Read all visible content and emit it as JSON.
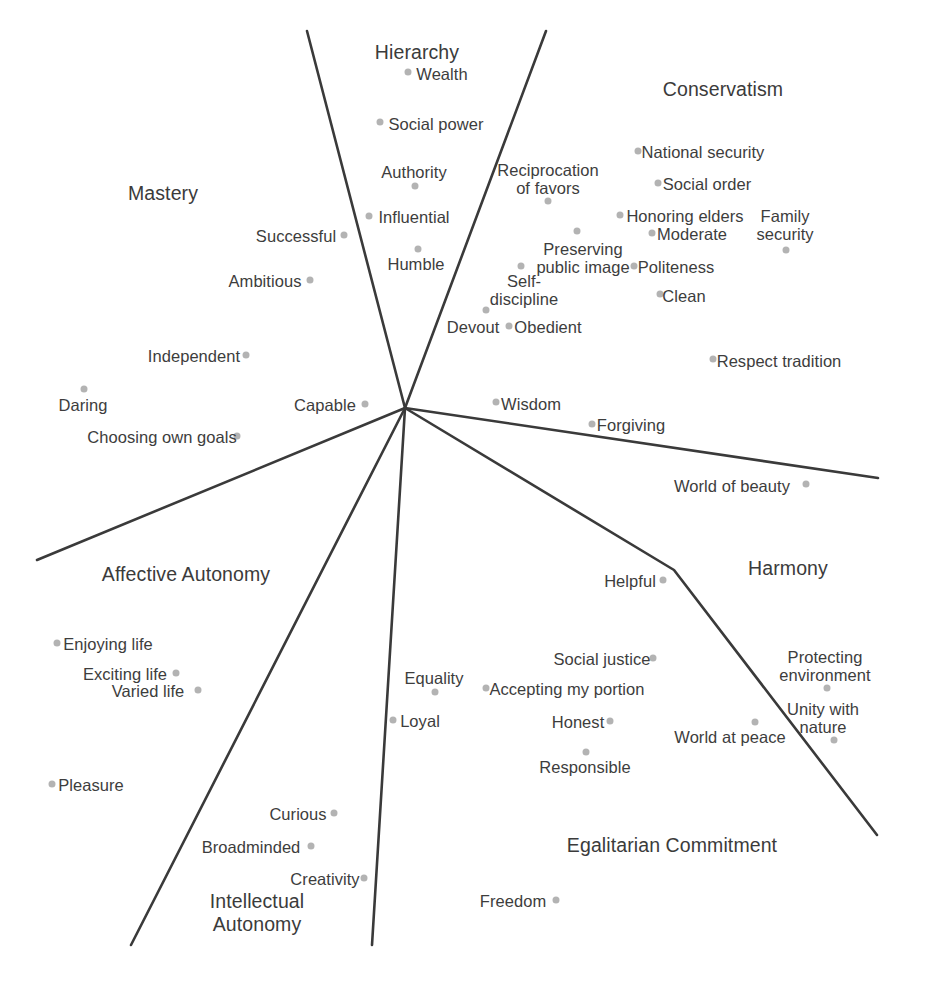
{
  "figure": {
    "type": "scatter",
    "title": "",
    "background_color": "#ffffff",
    "dot_color": "#b3b3b3",
    "line_color": "#3a3a3a",
    "text_color": "#3d3d3d",
    "width": 926,
    "height": 982,
    "origin": {
      "x": 405,
      "y": 408
    }
  },
  "regions": [
    {
      "name": "hierarchy",
      "label": "Hierarchy",
      "x": 417,
      "y": 52
    },
    {
      "name": "conservatism",
      "label": "Conservatism",
      "x": 723,
      "y": 89
    },
    {
      "name": "mastery",
      "label": "Mastery",
      "x": 163,
      "y": 193
    },
    {
      "name": "affective-autonomy",
      "label": "Affective Autonomy",
      "x": 186,
      "y": 574
    },
    {
      "name": "harmony",
      "label": "Harmony",
      "x": 788,
      "y": 568
    },
    {
      "name": "egalitarian-commitment",
      "label": "Egalitarian Commitment",
      "x": 672,
      "y": 845
    },
    {
      "name": "intellectual-autonomy",
      "label": "Intellectual\nAutonomy",
      "x": 257,
      "y": 913
    }
  ],
  "dividers": [
    {
      "name": "hierarchy-mastery-divider",
      "points": [
        [
          307,
          31
        ],
        [
          405,
          408
        ]
      ]
    },
    {
      "name": "hierarchy-conservatism-divider",
      "points": [
        [
          546,
          31
        ],
        [
          405,
          408
        ]
      ]
    },
    {
      "name": "conservatism-harmony-divider",
      "points": [
        [
          405,
          408
        ],
        [
          878,
          478
        ]
      ]
    },
    {
      "name": "harmony-egalitarian-divider",
      "points": [
        [
          405,
          408
        ],
        [
          674,
          570
        ],
        [
          877,
          835
        ]
      ]
    },
    {
      "name": "egalitarian-intellectual-divider",
      "points": [
        [
          405,
          408
        ],
        [
          372,
          945
        ]
      ]
    },
    {
      "name": "intellectual-affective-divider",
      "points": [
        [
          405,
          408
        ],
        [
          131,
          945
        ]
      ]
    },
    {
      "name": "affective-mastery-divider",
      "points": [
        [
          405,
          408
        ],
        [
          37,
          560
        ]
      ]
    }
  ],
  "values": [
    {
      "name": "wealth",
      "label": "Wealth",
      "tx": 442,
      "ty": 74,
      "dx": 408,
      "dy": 72
    },
    {
      "name": "social-power",
      "label": "Social power",
      "tx": 436,
      "ty": 124,
      "dx": 380,
      "dy": 122
    },
    {
      "name": "authority",
      "label": "Authority",
      "tx": 414,
      "ty": 172,
      "dx": 415,
      "dy": 186
    },
    {
      "name": "influential",
      "label": "Influential",
      "tx": 414,
      "ty": 217,
      "dx": 369,
      "dy": 216
    },
    {
      "name": "humble",
      "label": "Humble",
      "tx": 416,
      "ty": 264,
      "dx": 418,
      "dy": 249
    },
    {
      "name": "successful",
      "label": "Successful",
      "tx": 296,
      "ty": 236,
      "dx": 344,
      "dy": 235
    },
    {
      "name": "ambitious",
      "label": "Ambitious",
      "tx": 265,
      "ty": 281,
      "dx": 310,
      "dy": 280
    },
    {
      "name": "independent",
      "label": "Independent",
      "tx": 194,
      "ty": 356,
      "dx": 246,
      "dy": 355
    },
    {
      "name": "daring",
      "label": "Daring",
      "tx": 83,
      "ty": 405,
      "dx": 84,
      "dy": 389
    },
    {
      "name": "choosing-own-goals",
      "label": "Choosing own goals",
      "tx": 162,
      "ty": 437,
      "dx": 237,
      "dy": 436
    },
    {
      "name": "capable",
      "label": "Capable",
      "tx": 325,
      "ty": 405,
      "dx": 365,
      "dy": 404
    },
    {
      "name": "reciprocation-of-favors",
      "label": "Reciprocation\nof favors",
      "tx": 548,
      "ty": 179,
      "dx": 548,
      "dy": 201
    },
    {
      "name": "preserving-public-image",
      "label": "Preserving\npublic image",
      "tx": 583,
      "ty": 258,
      "dx": 577,
      "dy": 231
    },
    {
      "name": "self-discipline",
      "label": "Self-\ndiscipline",
      "tx": 524,
      "ty": 290,
      "dx": 521,
      "dy": 266
    },
    {
      "name": "devout",
      "label": "Devout",
      "tx": 473,
      "ty": 327,
      "dx": 486,
      "dy": 310
    },
    {
      "name": "obedient",
      "label": "Obedient",
      "tx": 548,
      "ty": 327,
      "dx": 509,
      "dy": 326
    },
    {
      "name": "national-security",
      "label": "National security",
      "tx": 703,
      "ty": 152,
      "dx": 638,
      "dy": 151
    },
    {
      "name": "social-order",
      "label": "Social order",
      "tx": 707,
      "ty": 184,
      "dx": 658,
      "dy": 183
    },
    {
      "name": "honoring-elders",
      "label": "Honoring elders",
      "tx": 685,
      "ty": 216,
      "dx": 620,
      "dy": 215
    },
    {
      "name": "moderate",
      "label": "Moderate",
      "tx": 692,
      "ty": 234,
      "dx": 652,
      "dy": 233
    },
    {
      "name": "politeness",
      "label": "Politeness",
      "tx": 676,
      "ty": 267,
      "dx": 634,
      "dy": 266
    },
    {
      "name": "clean",
      "label": "Clean",
      "tx": 684,
      "ty": 296,
      "dx": 660,
      "dy": 294
    },
    {
      "name": "family-security",
      "label": "Family\nsecurity",
      "tx": 785,
      "ty": 225,
      "dx": 786,
      "dy": 250
    },
    {
      "name": "respect-tradition",
      "label": "Respect tradition",
      "tx": 779,
      "ty": 361,
      "dx": 713,
      "dy": 359
    },
    {
      "name": "wisdom",
      "label": "Wisdom",
      "tx": 531,
      "ty": 404,
      "dx": 496,
      "dy": 402
    },
    {
      "name": "forgiving",
      "label": "Forgiving",
      "tx": 631,
      "ty": 425,
      "dx": 592,
      "dy": 424
    },
    {
      "name": "world-of-beauty",
      "label": "World of beauty",
      "tx": 732,
      "ty": 486,
      "dx": 806,
      "dy": 484
    },
    {
      "name": "helpful",
      "label": "Helpful",
      "tx": 630,
      "ty": 581,
      "dx": 663,
      "dy": 580
    },
    {
      "name": "enjoying-life",
      "label": "Enjoying life",
      "tx": 108,
      "ty": 644,
      "dx": 57,
      "dy": 643
    },
    {
      "name": "exciting-life",
      "label": "Exciting life",
      "tx": 125,
      "ty": 674,
      "dx": 176,
      "dy": 673
    },
    {
      "name": "varied-life",
      "label": "Varied life",
      "tx": 148,
      "ty": 691,
      "dx": 198,
      "dy": 690
    },
    {
      "name": "pleasure",
      "label": "Pleasure",
      "tx": 91,
      "ty": 785,
      "dx": 52,
      "dy": 784
    },
    {
      "name": "curious",
      "label": "Curious",
      "tx": 298,
      "ty": 814,
      "dx": 334,
      "dy": 813
    },
    {
      "name": "broadminded",
      "label": "Broadminded",
      "tx": 251,
      "ty": 847,
      "dx": 311,
      "dy": 846
    },
    {
      "name": "creativity",
      "label": "Creativity",
      "tx": 325,
      "ty": 879,
      "dx": 364,
      "dy": 878
    },
    {
      "name": "equality",
      "label": "Equality",
      "tx": 434,
      "ty": 678,
      "dx": 435,
      "dy": 692
    },
    {
      "name": "loyal",
      "label": "Loyal",
      "tx": 420,
      "ty": 721,
      "dx": 393,
      "dy": 720
    },
    {
      "name": "social-justice",
      "label": "Social justice",
      "tx": 602,
      "ty": 659,
      "dx": 653,
      "dy": 658
    },
    {
      "name": "accepting-my-portion",
      "label": "Accepting my portion",
      "tx": 567,
      "ty": 689,
      "dx": 486,
      "dy": 688
    },
    {
      "name": "honest",
      "label": "Honest",
      "tx": 578,
      "ty": 722,
      "dx": 610,
      "dy": 721
    },
    {
      "name": "responsible",
      "label": "Responsible",
      "tx": 585,
      "ty": 767,
      "dx": 586,
      "dy": 752
    },
    {
      "name": "world-at-peace",
      "label": "World at peace",
      "tx": 730,
      "ty": 737,
      "dx": 755,
      "dy": 722
    },
    {
      "name": "protecting-environment",
      "label": "Protecting\nenvironment",
      "tx": 825,
      "ty": 666,
      "dx": 827,
      "dy": 688
    },
    {
      "name": "unity-with-nature",
      "label": "Unity with\nnature",
      "tx": 823,
      "ty": 718,
      "dx": 834,
      "dy": 740
    },
    {
      "name": "freedom",
      "label": "Freedom",
      "tx": 513,
      "ty": 901,
      "dx": 556,
      "dy": 900
    }
  ]
}
